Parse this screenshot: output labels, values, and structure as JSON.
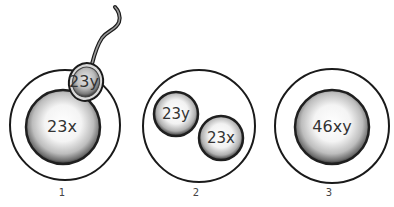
{
  "diagram": {
    "type": "fertilization-stages",
    "colors": {
      "outline": "#1a1a1a",
      "label_text": "#333333",
      "background": "#ffffff"
    },
    "stages": [
      {
        "number": "1",
        "description": "Sperm entering egg",
        "egg_nucleus_label": "23x",
        "sperm_head_label": "23y"
      },
      {
        "number": "2",
        "description": "Two pronuclei inside egg",
        "pronucleus_labels": [
          "23y",
          "23x"
        ]
      },
      {
        "number": "3",
        "description": "Zygote with fused nucleus",
        "nucleus_label": "46xy"
      }
    ]
  }
}
